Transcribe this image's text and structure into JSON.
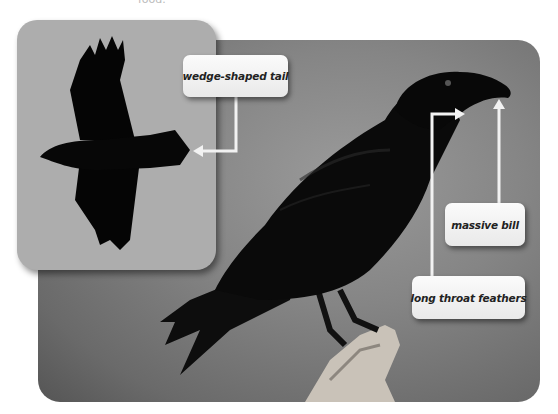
{
  "caption_fragment": "food.",
  "main_photo": {
    "subject": "perched raven",
    "background_color": "#858585"
  },
  "inset_photo": {
    "subject": "raven in flight",
    "background_color": "#adadad"
  },
  "labels": {
    "tail": "wedge-shaped tail",
    "bill": "massive bill",
    "throat": "long throat feathers"
  },
  "colors": {
    "arrow": "#f2f2f2",
    "label_bg": "#f5f5f5",
    "label_text": "#222222",
    "bird": "#0a0a0a"
  }
}
